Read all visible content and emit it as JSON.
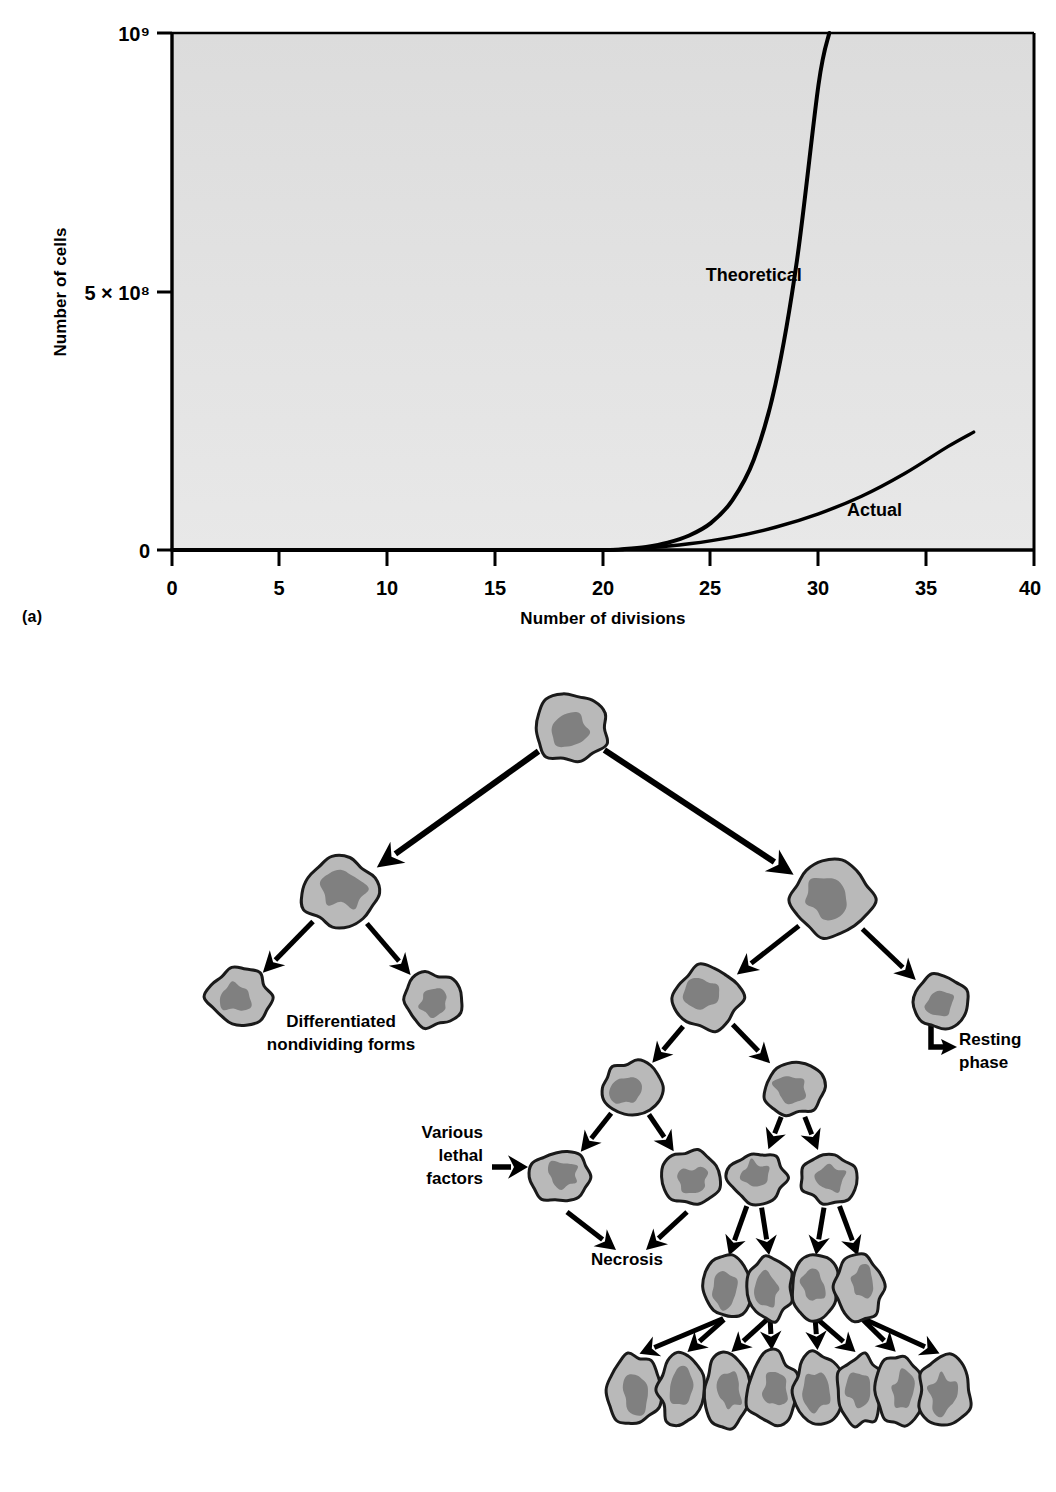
{
  "figure": {
    "panel_a_letter": "(a)",
    "panel_b_letter": "(b)"
  },
  "chart_data": {
    "type": "line",
    "title": "",
    "xlabel": "Number of divisions",
    "ylabel": "Number of cells",
    "xlim": [
      0,
      40
    ],
    "ylim": [
      0,
      1000000000
    ],
    "xticks": [
      0,
      5,
      10,
      15,
      20,
      25,
      30,
      35,
      40
    ],
    "xtick_labels": [
      "0",
      "5",
      "10",
      "15",
      "20",
      "25",
      "30",
      "35",
      "40"
    ],
    "ytick_labels": [
      "0",
      "5 × 10⁸",
      "10⁹"
    ],
    "ytick_values": [
      0,
      500000000,
      1000000000
    ],
    "grid": false,
    "legend_position": "inline-annotations",
    "plot_background": "#dedede",
    "line_color": "#000000",
    "series": [
      {
        "name": "Theoretical",
        "label": "Theoretical",
        "label_x": 27.0,
        "label_y": 520000000,
        "x": [
          0,
          5,
          10,
          15,
          20,
          21,
          22,
          23,
          24,
          25,
          26,
          27,
          28,
          29,
          30,
          30.5
        ],
        "y": [
          0,
          0,
          0,
          0,
          0,
          2000000,
          6000000,
          14000000,
          28000000,
          52000000,
          96000000,
          175000000,
          320000000,
          560000000,
          900000000,
          1000000000
        ]
      },
      {
        "name": "Actual",
        "label": "Actual",
        "label_x": 32.6,
        "label_y": 66000000,
        "x": [
          0,
          5,
          10,
          15,
          20,
          22,
          24,
          26,
          28,
          30,
          32,
          34,
          36,
          37.2
        ],
        "y": [
          0,
          0,
          0,
          0,
          0,
          4000000,
          12000000,
          25000000,
          44000000,
          70000000,
          104000000,
          148000000,
          200000000,
          228000000
        ]
      }
    ]
  },
  "diagram": {
    "type": "cell-lineage-tree",
    "labels": {
      "differentiated": "Differentiated\nnondividing forms",
      "differentiated_line1": "Differentiated",
      "differentiated_line2": "nondividing forms",
      "resting": "Resting\nphase",
      "resting_line1": "Resting",
      "resting_line2": "phase",
      "lethal_line1": "Various",
      "lethal_line2": "lethal",
      "lethal_line3": "factors",
      "necrosis": "Necrosis"
    },
    "colors": {
      "cytoplasm": "#b9b9b9",
      "nucleus": "#808080",
      "outline": "#1a1a1a",
      "arrow": "#000000"
    },
    "cells": [
      {
        "id": "root",
        "cx": 571,
        "cy": 78,
        "r": 36,
        "seed": 3
      },
      {
        "id": "left-1",
        "cx": 341,
        "cy": 243,
        "r": 38,
        "seed": 7
      },
      {
        "id": "right-1",
        "cx": 832,
        "cy": 250,
        "r": 40,
        "seed": 11
      },
      {
        "id": "left-diff-a",
        "cx": 239,
        "cy": 347,
        "r": 31,
        "seed": 5
      },
      {
        "id": "left-diff-b",
        "cx": 432,
        "cy": 350,
        "r": 29,
        "seed": 13
      },
      {
        "id": "right-mid",
        "cx": 707,
        "cy": 348,
        "r": 34,
        "seed": 17
      },
      {
        "id": "resting",
        "cx": 939,
        "cy": 352,
        "r": 28,
        "seed": 19
      },
      {
        "id": "mid-l",
        "cx": 631,
        "cy": 438,
        "r": 29,
        "seed": 23
      },
      {
        "id": "mid-r",
        "cx": 793,
        "cy": 437,
        "r": 29,
        "seed": 29
      },
      {
        "id": "lethal-1",
        "cx": 561,
        "cy": 527,
        "r": 29,
        "seed": 31
      },
      {
        "id": "lethal-2",
        "cx": 691,
        "cy": 527,
        "r": 28,
        "seed": 37
      },
      {
        "id": "prolif-1",
        "cx": 757,
        "cy": 528,
        "r": 28,
        "seed": 41
      },
      {
        "id": "prolif-2",
        "cx": 829,
        "cy": 528,
        "r": 27,
        "seed": 43
      }
    ],
    "row_cluster_4": [
      {
        "cx": 727,
        "cy": 637,
        "rx": 23,
        "ry": 32,
        "seed": 47
      },
      {
        "cx": 770,
        "cy": 637,
        "rx": 23,
        "ry": 32,
        "seed": 53
      },
      {
        "cx": 815,
        "cy": 637,
        "rx": 23,
        "ry": 32,
        "seed": 59
      },
      {
        "cx": 860,
        "cy": 637,
        "rx": 24,
        "ry": 32,
        "seed": 61
      }
    ],
    "row_cluster_8": [
      {
        "cx": 634,
        "cy": 740,
        "rx": 26,
        "ry": 36,
        "seed": 67
      },
      {
        "cx": 683,
        "cy": 740,
        "rx": 24,
        "ry": 36,
        "seed": 71
      },
      {
        "cx": 727,
        "cy": 740,
        "rx": 22,
        "ry": 36,
        "seed": 73
      },
      {
        "cx": 772,
        "cy": 740,
        "rx": 25,
        "ry": 36,
        "seed": 79
      },
      {
        "cx": 818,
        "cy": 740,
        "rx": 25,
        "ry": 36,
        "seed": 83
      },
      {
        "cx": 860,
        "cy": 740,
        "rx": 22,
        "ry": 36,
        "seed": 89
      },
      {
        "cx": 900,
        "cy": 740,
        "rx": 23,
        "ry": 36,
        "seed": 97
      },
      {
        "cx": 945,
        "cy": 740,
        "rx": 26,
        "ry": 36,
        "seed": 101
      }
    ]
  }
}
